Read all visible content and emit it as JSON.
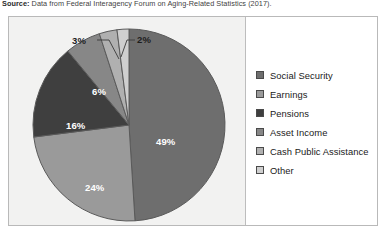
{
  "source": {
    "label": "Source:",
    "text": " Data from Federal Interagency Forum on Aging-Related Statistics (2017)."
  },
  "chart_data": {
    "type": "pie",
    "title": "",
    "subtitle": "",
    "xlabel": "",
    "ylabel": "",
    "legend_position": "right",
    "start_angle_deg": 0,
    "direction": "clockwise",
    "categories": [
      "Social Security",
      "Earnings",
      "Pensions",
      "Asset Income",
      "Cash Public Assistance",
      "Other"
    ],
    "values": [
      49,
      24,
      16,
      6,
      3,
      2
    ],
    "value_labels": [
      "49%",
      "24%",
      "16%",
      "6%",
      "3%",
      "2%"
    ],
    "label_placement": [
      "inside",
      "inside",
      "inside",
      "inside",
      "outside",
      "outside"
    ],
    "colors": [
      "#6e6e6e",
      "#9a9a9a",
      "#3f3f3f",
      "#878787",
      "#b0b0b0",
      "#cfcfcf"
    ],
    "slice_border_color": "#5a5a5a",
    "leader_line_color": "#3a3a3a",
    "inside_label_color": "#ffffff",
    "outside_label_color": "#1d1d1d"
  },
  "legend": {
    "items": [
      {
        "label": "Social Security",
        "color": "#6e6e6e"
      },
      {
        "label": "Earnings",
        "color": "#9a9a9a"
      },
      {
        "label": "Pensions",
        "color": "#3f3f3f"
      },
      {
        "label": "Asset Income",
        "color": "#878787"
      },
      {
        "label": "Cash Public Assistance",
        "color": "#b0b0b0"
      },
      {
        "label": "Other",
        "color": "#cfcfcf"
      }
    ]
  }
}
